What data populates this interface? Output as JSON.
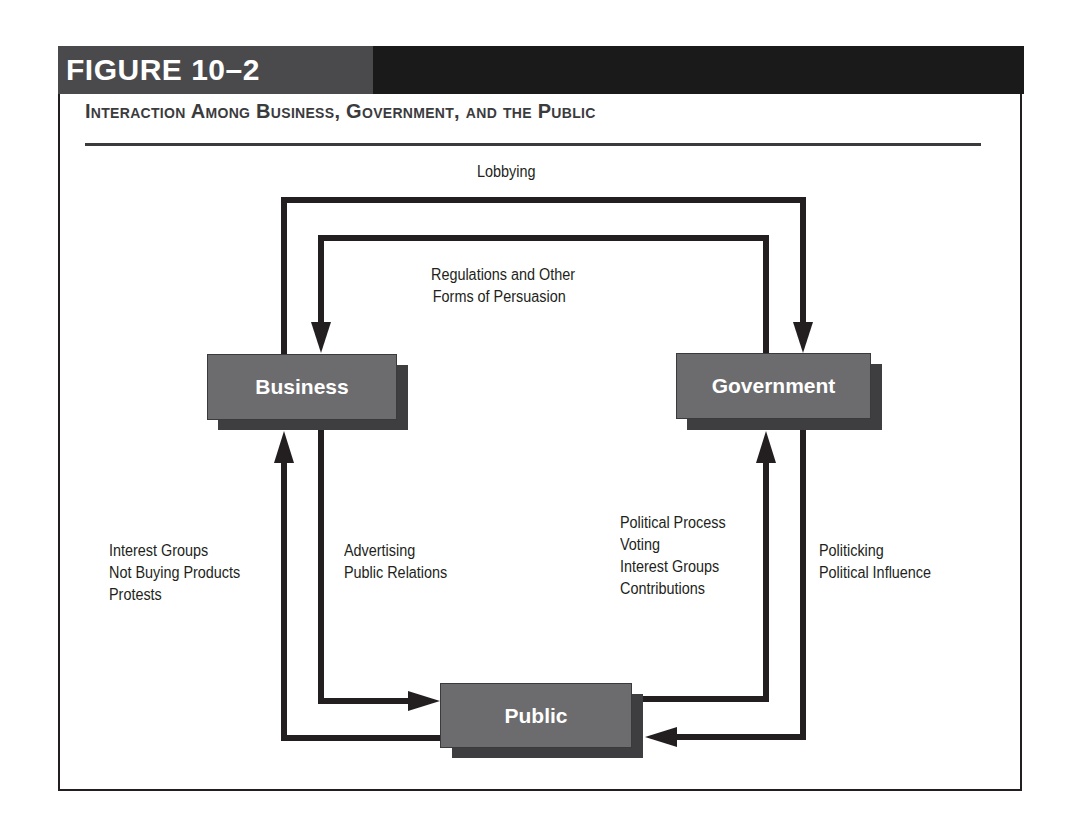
{
  "figure": {
    "label": "FIGURE 10–2",
    "title": "Interaction Among Business, Government, and the Public"
  },
  "nodes": {
    "business": "Business",
    "government": "Government",
    "public": "Public"
  },
  "flows": {
    "lobbying": {
      "lines": [
        "Lobbying"
      ],
      "from": "Business",
      "to": "Government"
    },
    "regulations": {
      "lines": [
        "Regulations and Other",
        "Forms of Persuasion"
      ],
      "from": "Government",
      "to": "Business"
    },
    "public_to_business": {
      "lines": [
        "Interest Groups",
        "Not Buying Products",
        "Protests"
      ],
      "from": "Public",
      "to": "Business"
    },
    "business_to_public": {
      "lines": [
        "Advertising",
        "Public Relations"
      ],
      "from": "Business",
      "to": "Public"
    },
    "public_to_government": {
      "lines": [
        "Political Process",
        "Voting",
        "Interest Groups",
        "Contributions"
      ],
      "from": "Public",
      "to": "Government"
    },
    "government_to_public": {
      "lines": [
        "Politicking",
        "Political Influence"
      ],
      "from": "Government",
      "to": "Public"
    }
  },
  "colors": {
    "header_dark_gray": "#4a4a4c",
    "header_black": "#1b1a1b",
    "node_fill": "#6c6c6e",
    "node_shadow": "#3e3e40",
    "line": "#231f20"
  }
}
